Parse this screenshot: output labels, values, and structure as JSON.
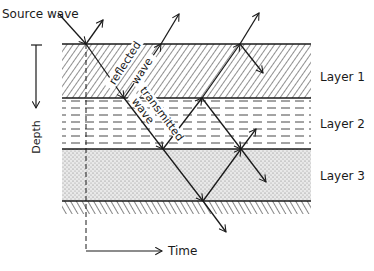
{
  "diagram": {
    "source_label": "Source wave",
    "depth_label": "Depth",
    "time_label": "Time",
    "reflected_label_1": "reflected",
    "reflected_label_2": "wave",
    "transmitted_label_1": "transmitted",
    "transmitted_label_2": "wave",
    "layers": [
      {
        "label": "Layer 1",
        "pattern": "diagonal-hatch"
      },
      {
        "label": "Layer 2",
        "pattern": "dashed-lines"
      },
      {
        "label": "Layer 3",
        "pattern": "stipple"
      }
    ],
    "colors": {
      "ink": "#1a1a1a",
      "background": "#ffffff"
    }
  }
}
